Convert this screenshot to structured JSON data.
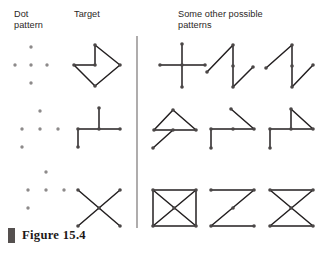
{
  "figure": {
    "caption_label": "Figure 15.4",
    "caption_number": "15.4",
    "headers": {
      "dot_pattern": "Dot\npattern",
      "target": "Target",
      "others": "Some other possible\npatterns"
    },
    "colors": {
      "stroke": "#231f20",
      "dot": "#8d8a8a",
      "vertex": "#4b4747",
      "divider": "#9b9898",
      "caption_bar": "#55504f",
      "text": "#2b2726"
    },
    "divider": {
      "x": 137,
      "y_top": 36,
      "y_bottom": 228
    },
    "geometry": {
      "dot_grid_label": "5-dot quincunx",
      "row_count": 3,
      "columns_per_row": 5
    },
    "rows": [
      {
        "id": "row-1",
        "dot_pattern": {
          "name": "quincunx-dot-pattern",
          "dots": [
            [
              31,
              47
            ],
            [
              15,
              65
            ],
            [
              31,
              65
            ],
            [
              47,
              65
            ],
            [
              31,
              83
            ]
          ]
        },
        "target": {
          "name": "arrow-chevron-target",
          "points": [
            [
              74,
              65
            ],
            [
              95,
              65
            ],
            [
              95,
              45
            ],
            [
              120,
              65
            ],
            [
              95,
              86
            ],
            [
              74,
              65
            ]
          ],
          "closed": false,
          "vertices": [
            [
              74,
              65
            ],
            [
              95,
              65
            ],
            [
              95,
              45
            ],
            [
              120,
              65
            ],
            [
              95,
              86
            ]
          ]
        },
        "alternatives": [
          {
            "name": "plus-cross-pattern",
            "segments": [
              [
                [
                  160,
                  65
                ],
                [
                  205,
                  65
                ]
              ],
              [
                [
                  182,
                  44
                ],
                [
                  182,
                  87
                ]
              ]
            ],
            "vertices": [
              [
                160,
                65
              ],
              [
                205,
                65
              ],
              [
                182,
                44
              ],
              [
                182,
                87
              ],
              [
                182,
                65
              ]
            ]
          },
          {
            "name": "lightning-zigzag-pattern",
            "segments": [
              [
                [
                  207,
                  72
                ],
                [
                  233,
                  45
                ]
              ],
              [
                [
                  233,
                  45
                ],
                [
                  233,
                  87
                ]
              ],
              [
                [
                  233,
                  87
                ],
                [
                  253,
                  67
                ]
              ]
            ],
            "vertices": [
              [
                207,
                72
              ],
              [
                233,
                45
              ],
              [
                233,
                87
              ],
              [
                253,
                67
              ],
              [
                233,
                66
              ]
            ]
          },
          {
            "name": "crossed-zigzag-pattern",
            "segments": [
              [
                [
                  266,
                  68
                ],
                [
                  292,
                  45
                ]
              ],
              [
                [
                  292,
                  45
                ],
                [
                  292,
                  87
                ]
              ],
              [
                [
                  292,
                  87
                ],
                [
                  313,
                  65
                ]
              ]
            ],
            "vertices": [
              [
                266,
                68
              ],
              [
                292,
                45
              ],
              [
                292,
                87
              ],
              [
                313,
                65
              ],
              [
                292,
                66
              ]
            ]
          }
        ]
      },
      {
        "id": "row-2",
        "dot_pattern": {
          "name": "quincunx-dot-pattern",
          "dots": [
            [
              40,
              111
            ],
            [
              22,
              129
            ],
            [
              40,
              129
            ],
            [
              58,
              129
            ],
            [
              22,
              147
            ]
          ]
        },
        "target": {
          "name": "tee-with-stem-target",
          "segments": [
            [
              [
                78,
                147
              ],
              [
                78,
                129
              ]
            ],
            [
              [
                78,
                129
              ],
              [
                120,
                129
              ]
            ],
            [
              [
                99,
                129
              ],
              [
                99,
                108
              ]
            ]
          ],
          "vertices": [
            [
              78,
              147
            ],
            [
              78,
              129
            ],
            [
              120,
              129
            ],
            [
              99,
              108
            ],
            [
              99,
              129
            ]
          ]
        },
        "alternatives": [
          {
            "name": "triangle-with-tail-pattern",
            "segments": [
              [
                [
                  153,
                  148
                ],
                [
                  173,
                  130
                ]
              ],
              [
                [
                  154,
                  130
                ],
                [
                  173,
                  110
                ]
              ],
              [
                [
                  173,
                  110
                ],
                [
                  196,
                  130
                ]
              ],
              [
                [
                  173,
                  130
                ],
                [
                  196,
                  130
                ]
              ],
              [
                [
                  154,
                  130
                ],
                [
                  173,
                  130
                ]
              ]
            ],
            "vertices": [
              [
                153,
                148
              ],
              [
                154,
                130
              ],
              [
                173,
                110
              ],
              [
                196,
                130
              ],
              [
                173,
                130
              ]
            ]
          },
          {
            "name": "flag-with-pole-pattern",
            "segments": [
              [
                [
                  211,
                  148
                ],
                [
                  211,
                  129
                ]
              ],
              [
                [
                  211,
                  129
                ],
                [
                  254,
                  129
                ]
              ],
              [
                [
                  254,
                  129
                ],
                [
                  231,
                  109
                ]
              ]
            ],
            "vertices": [
              [
                211,
                148
              ],
              [
                211,
                129
              ],
              [
                254,
                129
              ],
              [
                231,
                109
              ],
              [
                233,
                129
              ]
            ]
          },
          {
            "name": "right-triangle-with-pole-pattern",
            "segments": [
              [
                [
                  270,
                  148
                ],
                [
                  270,
                  129
                ]
              ],
              [
                [
                  270,
                  129
                ],
                [
                  313,
                  129
                ]
              ],
              [
                [
                  291,
                  129
                ],
                [
                  291,
                  109
                ]
              ],
              [
                [
                  291,
                  109
                ],
                [
                  313,
                  129
                ]
              ]
            ],
            "vertices": [
              [
                270,
                148
              ],
              [
                270,
                129
              ],
              [
                313,
                129
              ],
              [
                291,
                109
              ],
              [
                291,
                129
              ]
            ]
          }
        ]
      },
      {
        "id": "row-3",
        "dot_pattern": {
          "name": "quincunx-dot-pattern",
          "dots": [
            [
              46,
              172
            ],
            [
              28,
              190
            ],
            [
              46,
              190
            ],
            [
              64,
              190
            ],
            [
              28,
              208
            ]
          ]
        },
        "target": {
          "name": "x-cross-target",
          "segments": [
            [
              [
                78,
                190
              ],
              [
                120,
                226
              ]
            ],
            [
              [
                120,
                190
              ],
              [
                78,
                226
              ]
            ]
          ],
          "vertices": [
            [
              78,
              190
            ],
            [
              120,
              190
            ],
            [
              78,
              226
            ],
            [
              120,
              226
            ],
            [
              99,
              208
            ]
          ]
        },
        "alternatives": [
          {
            "name": "boxed-x-pattern",
            "segments": [
              [
                [
                  153,
                  190
                ],
                [
                  196,
                  190
                ]
              ],
              [
                [
                  196,
                  190
                ],
                [
                  196,
                  226
                ]
              ],
              [
                [
                  196,
                  226
                ],
                [
                  153,
                  226
                ]
              ],
              [
                [
                  153,
                  226
                ],
                [
                  153,
                  190
                ]
              ],
              [
                [
                  153,
                  190
                ],
                [
                  196,
                  226
                ]
              ],
              [
                [
                  196,
                  190
                ],
                [
                  153,
                  226
                ]
              ]
            ],
            "vertices": [
              [
                153,
                190
              ],
              [
                196,
                190
              ],
              [
                153,
                226
              ],
              [
                196,
                226
              ],
              [
                174,
                208
              ]
            ]
          },
          {
            "name": "z-shape-pattern",
            "segments": [
              [
                [
                  211,
                  190
                ],
                [
                  254,
                  190
                ]
              ],
              [
                [
                  254,
                  190
                ],
                [
                  211,
                  226
                ]
              ],
              [
                [
                  211,
                  226
                ],
                [
                  254,
                  226
                ]
              ]
            ],
            "vertices": [
              [
                211,
                190
              ],
              [
                254,
                190
              ],
              [
                211,
                226
              ],
              [
                254,
                226
              ],
              [
                233,
                208
              ]
            ]
          },
          {
            "name": "bowtie-hourglass-pattern",
            "segments": [
              [
                [
                  270,
                  190
                ],
                [
                  313,
                  190
                ]
              ],
              [
                [
                  270,
                  190
                ],
                [
                  313,
                  226
                ]
              ],
              [
                [
                  313,
                  190
                ],
                [
                  270,
                  226
                ]
              ],
              [
                [
                  270,
                  226
                ],
                [
                  313,
                  226
                ]
              ]
            ],
            "vertices": [
              [
                270,
                190
              ],
              [
                313,
                190
              ],
              [
                270,
                226
              ],
              [
                313,
                226
              ],
              [
                291,
                208
              ]
            ]
          }
        ]
      }
    ]
  }
}
